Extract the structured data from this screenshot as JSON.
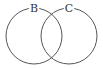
{
  "diagram": {
    "type": "venn",
    "sets": [
      {
        "label": "B",
        "cx": 34,
        "cy": 36,
        "r": 28
      },
      {
        "label": "C",
        "cx": 69,
        "cy": 36,
        "r": 28
      }
    ],
    "colors": {
      "stroke": "#555555",
      "background": "#ffffff",
      "label": "#333333"
    }
  }
}
